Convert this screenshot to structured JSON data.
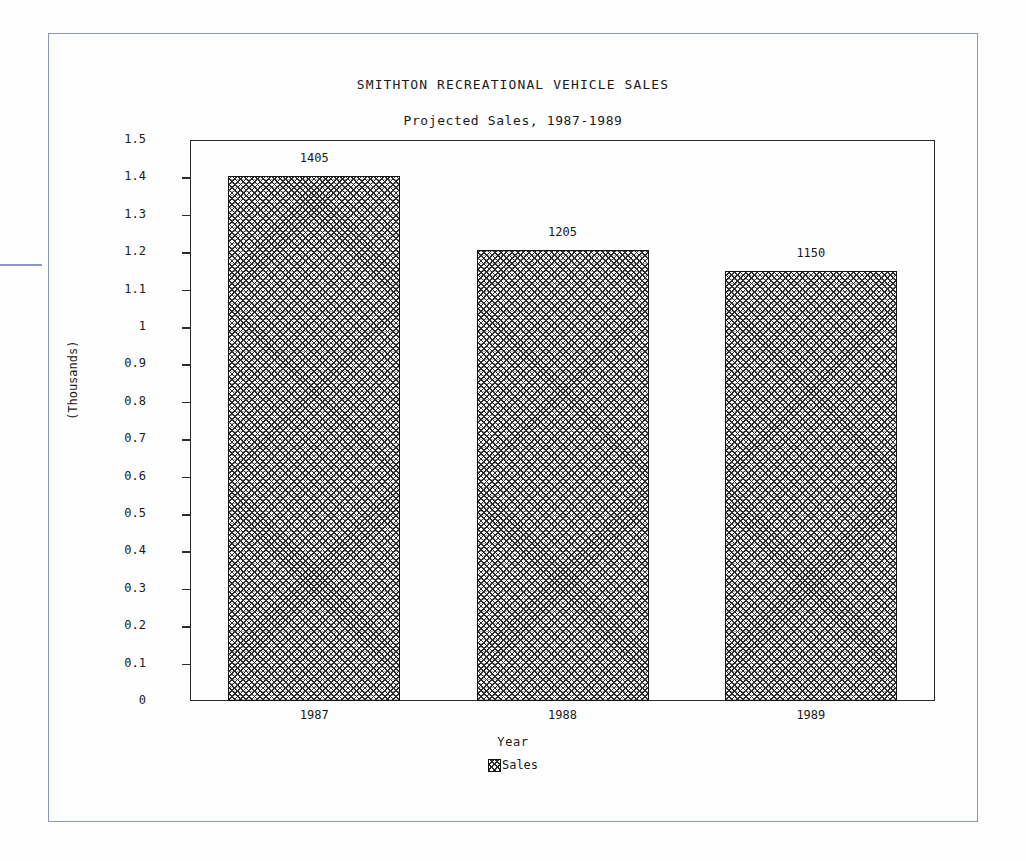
{
  "chart_data": {
    "type": "bar",
    "title": "SMITHTON RECREATIONAL VEHICLE SALES",
    "subtitle": "Projected Sales, 1987-1989",
    "xlabel": "Year",
    "ylabel": "(Thousands)",
    "categories": [
      "1987",
      "1988",
      "1989"
    ],
    "values": [
      1.405,
      1.205,
      1.15
    ],
    "data_labels": [
      "1405",
      "1205",
      "1150"
    ],
    "ylim": [
      0,
      1.5
    ],
    "ytick_labels": [
      "1.5",
      "1.4",
      "1.3",
      "1.2",
      "1.1",
      "1",
      "0.9",
      "0.8",
      "0.7",
      "0.6",
      "0.5",
      "0.4",
      "0.3",
      "0.2",
      "0.1",
      "0"
    ],
    "ytick_values": [
      1.5,
      1.4,
      1.3,
      1.2,
      1.1,
      1.0,
      0.9,
      0.8,
      0.7,
      0.6,
      0.5,
      0.4,
      0.3,
      0.2,
      0.1,
      0
    ],
    "grid": false,
    "legend": {
      "position": "bottom",
      "entries": [
        {
          "label": "Sales",
          "pattern": "cross-hatch"
        }
      ]
    },
    "series": [
      {
        "name": "Sales",
        "values": [
          1.405,
          1.205,
          1.15
        ]
      }
    ]
  },
  "colors": {
    "frame": "#8c94c4",
    "axis": "#2b2b2b",
    "bar_outline": "#111111",
    "text": "#1a1a1a",
    "background": "#fefefe"
  }
}
